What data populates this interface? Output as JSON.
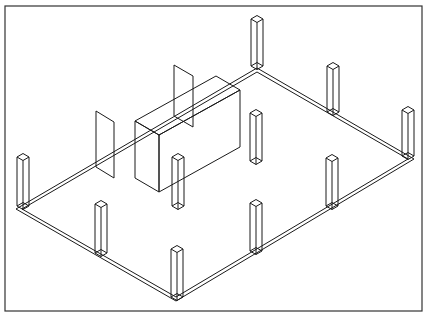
{
  "figure": {
    "description": "Isometric wireframe line drawing of a rectangular floor slab with 10 square columns, a rectangular box volume and two thin vertical wall panels",
    "style": "black line art on white",
    "colors": {
      "line": "#1a1a1a",
      "frame": "#333333",
      "background": "#ffffff"
    }
  },
  "frame": {
    "x": 5,
    "y": 6,
    "width": 417,
    "height": 305
  },
  "slab": {
    "corners": {
      "top": [
        257,
        68
      ],
      "right": [
        414,
        159
      ],
      "bottom": [
        176,
        301
      ],
      "left": [
        16,
        209
      ]
    },
    "thickness": 4
  },
  "columns": [
    {
      "id": "col-top-corner",
      "base": [
        257,
        66
      ],
      "height": 47
    },
    {
      "id": "col-left-corner",
      "base": [
        23,
        206
      ],
      "height": 49
    },
    {
      "id": "col-right-corner",
      "base": [
        408,
        156
      ],
      "height": 46
    },
    {
      "id": "col-bottom-corner",
      "base": [
        177,
        297
      ],
      "height": 48
    },
    {
      "id": "col-upper-edge-mid",
      "base": [
        333,
        112
      ],
      "height": 46
    },
    {
      "id": "col-lower-edge-mid",
      "base": [
        101,
        253
      ],
      "height": 49
    },
    {
      "id": "col-interior-upper",
      "base": [
        256,
        161
      ],
      "height": 48
    },
    {
      "id": "col-interior-left",
      "base": [
        178,
        206
      ],
      "height": 49
    },
    {
      "id": "col-interior-lower",
      "base": [
        256,
        251
      ],
      "height": 48
    },
    {
      "id": "col-interior-right",
      "base": [
        332,
        206
      ],
      "height": 48
    }
  ],
  "box": {
    "front_left_bottom": [
      135,
      178
    ],
    "front_right_bottom": [
      159,
      192
    ],
    "back_right_bottom": [
      240,
      147
    ],
    "height": 57,
    "depth_offset": [
      -24,
      -14
    ]
  },
  "panels": [
    {
      "id": "panel-left",
      "points": [
        [
          96,
          111
        ],
        [
          114,
          122
        ],
        [
          114,
          178
        ],
        [
          96,
          167
        ]
      ]
    },
    {
      "id": "panel-center",
      "points": [
        [
          174,
          65
        ],
        [
          193,
          76
        ],
        [
          193,
          127
        ],
        [
          174,
          116
        ]
      ]
    }
  ]
}
